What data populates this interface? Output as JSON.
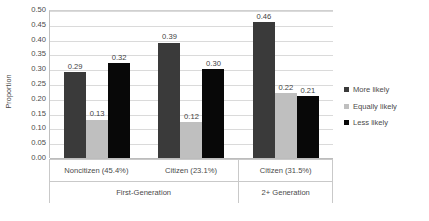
{
  "chart_data": {
    "type": "bar",
    "title": "",
    "xlabel": "",
    "ylabel": "Proportion",
    "ylim": [
      0.0,
      0.5
    ],
    "ytick_labels": [
      "0.50",
      "0.45",
      "0.40",
      "0.35",
      "0.30",
      "0.25",
      "0.20",
      "0.15",
      "0.10",
      "0.05",
      "0.00"
    ],
    "ytick_values": [
      0.5,
      0.45,
      0.4,
      0.35,
      0.3,
      0.25,
      0.2,
      0.15,
      0.1,
      0.05,
      0.0
    ],
    "grid": true,
    "legend_position": "right",
    "categories": [
      "Noncitizen (45.4%)",
      "Citizen (23.1%)",
      "Citizen (31.5%)"
    ],
    "supercategories": [
      {
        "label": "First-Generation",
        "span": 2
      },
      {
        "label": "2+ Generation",
        "span": 1
      }
    ],
    "series": [
      {
        "name": "More likely",
        "color": "#3a3a3a",
        "values": [
          0.29,
          0.39,
          0.46
        ],
        "labels": [
          "0.29",
          "0.39",
          "0.46"
        ]
      },
      {
        "name": "Equally likely",
        "color": "#bfbfbf",
        "values": [
          0.13,
          0.12,
          0.22
        ],
        "labels": [
          "0.13",
          "0.12",
          "0.22"
        ]
      },
      {
        "name": "Less likely",
        "color": "#080808",
        "values": [
          0.32,
          0.3,
          0.21
        ],
        "labels": [
          "0.32",
          "0.30",
          "0.21"
        ]
      }
    ]
  },
  "legend": {
    "items": [
      {
        "label": "More likely",
        "color": "#3a3a3a"
      },
      {
        "label": "Equally likely",
        "color": "#bfbfbf"
      },
      {
        "label": "Less likely",
        "color": "#080808"
      }
    ]
  },
  "axis": {
    "y_title": "Proportion"
  }
}
